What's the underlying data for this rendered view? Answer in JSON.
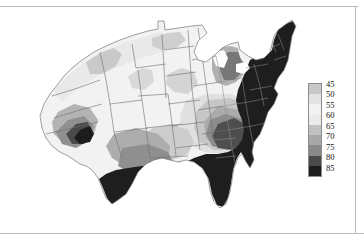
{
  "figure": {
    "kind": "contour-choropleth-map",
    "region": "Continental United States",
    "background_color": "#ffffff",
    "frame_color": "#bdbdbd"
  },
  "legend": {
    "name": "value-colorbar",
    "orientation": "vertical",
    "tick_labels": [
      "45",
      "50",
      "55",
      "60",
      "65",
      "70",
      "75",
      "80",
      "85"
    ],
    "swatch_colors": [
      "#c8c8c8",
      "#e3e3e3",
      "#f2f2f2",
      "#eaeaea",
      "#c2c2c2",
      "#a8a8a8",
      "#8a8a8a",
      "#4a4a4a",
      "#1c1c1c"
    ],
    "border_color": "#8d8d8d",
    "label_color": "#141414"
  },
  "chart_data": {
    "type": "heatmap",
    "title": "",
    "subtitle": "",
    "xlabel": "",
    "ylabel": "",
    "grid": false,
    "legend_position": "right",
    "colorbar_label": "",
    "colorbar_ticks": [
      45,
      50,
      55,
      60,
      65,
      70,
      75,
      80,
      85
    ],
    "value_range": [
      45,
      85
    ],
    "color_scale": "grayscale-sequential",
    "bands": [
      {
        "label": "45",
        "range": [
          45,
          50
        ],
        "color": "#c8c8c8"
      },
      {
        "label": "50",
        "range": [
          50,
          55
        ],
        "color": "#e3e3e3"
      },
      {
        "label": "55",
        "range": [
          55,
          60
        ],
        "color": "#f2f2f2"
      },
      {
        "label": "60",
        "range": [
          60,
          65
        ],
        "color": "#eaeaea"
      },
      {
        "label": "65",
        "range": [
          65,
          70
        ],
        "color": "#c2c2c2"
      },
      {
        "label": "70",
        "range": [
          70,
          75
        ],
        "color": "#a8a8a8"
      },
      {
        "label": "75",
        "range": [
          75,
          80
        ],
        "color": "#8a8a8a"
      },
      {
        "label": "80",
        "range": [
          80,
          85
        ],
        "color": "#4a4a4a"
      },
      {
        "label": "85",
        "range": [
          85,
          90
        ],
        "color": "#1c1c1c"
      }
    ],
    "regions": [
      {
        "name": "Pacific Northwest",
        "approx_value": 55
      },
      {
        "name": "Northern Rockies",
        "approx_value": 55
      },
      {
        "name": "Great Basin",
        "approx_value": 58
      },
      {
        "name": "Northern Plains",
        "approx_value": 57
      },
      {
        "name": "Upper Midwest",
        "approx_value": 58
      },
      {
        "name": "Great Lakes",
        "approx_value": 68
      },
      {
        "name": "Southern California Desert",
        "approx_value": 85
      },
      {
        "name": "Desert Southwest",
        "approx_value": 72
      },
      {
        "name": "Southern Plains",
        "approx_value": 78
      },
      {
        "name": "Texas",
        "approx_value": 85
      },
      {
        "name": "Gulf Coast",
        "approx_value": 85
      },
      {
        "name": "Southeast",
        "approx_value": 85
      },
      {
        "name": "Mid-Atlantic",
        "approx_value": 85
      },
      {
        "name": "Northeast",
        "approx_value": 85
      },
      {
        "name": "Florida",
        "approx_value": 85
      }
    ]
  }
}
